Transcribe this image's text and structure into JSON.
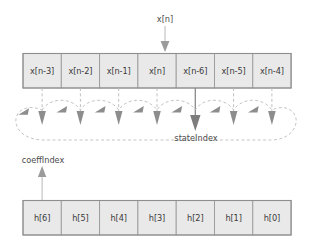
{
  "diagram": {
    "input_label": "x[n]",
    "state_pointer_label": "stateIndex",
    "coeff_pointer_label": "coeffIndex",
    "state_buffer": {
      "name": "state-buffer",
      "cells": [
        {
          "label": "x[n-3]"
        },
        {
          "label": "x[n-2]"
        },
        {
          "label": "x[n-1]"
        },
        {
          "label": "x[n]"
        },
        {
          "label": "x[n-6]"
        },
        {
          "label": "x[n-5]"
        },
        {
          "label": "x[n-4]"
        }
      ]
    },
    "coeff_buffer": {
      "name": "coefficient-buffer",
      "cells": [
        {
          "label": "h[6]"
        },
        {
          "label": "h[5]"
        },
        {
          "label": "h[4]"
        },
        {
          "label": "h[3]"
        },
        {
          "label": "h[2]"
        },
        {
          "label": "h[1]"
        },
        {
          "label": "h[0]"
        }
      ]
    },
    "input_arrow_target_index": 3,
    "state_pointer_index": 4,
    "coeff_pointer_index": 0,
    "colors": {
      "cell_fill": "#e9e9e9",
      "cell_stroke": "#9a9a9a",
      "dashed": "#bdbdbd",
      "arrow": "#8d8d8d",
      "arrow_highlight": "#7d7d7d",
      "text": "#3a3a3a",
      "background": "#ffffff"
    }
  }
}
